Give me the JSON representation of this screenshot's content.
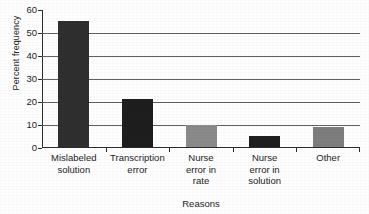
{
  "chart_data": {
    "type": "bar",
    "title": "",
    "subtitle": "",
    "xlabel": "Reasons",
    "ylabel": "Percent frequency",
    "categories": [
      "Mislabeled solution",
      "Transcription error",
      "Nurse error in rate",
      "Nurse error in solution",
      "Other"
    ],
    "category_lines": [
      [
        "Mislabeled",
        "solution"
      ],
      [
        "Transcription",
        "error"
      ],
      [
        "Nurse",
        "error in",
        "rate"
      ],
      [
        "Nurse",
        "error in",
        "solution"
      ],
      [
        "Other"
      ]
    ],
    "values": [
      55,
      21,
      9.5,
      5,
      8.5
    ],
    "bar_colors": [
      "#2f2f2f",
      "#1e1e1e",
      "#8a8a8a",
      "#1f1f1f",
      "#7e7e7e"
    ],
    "ylim": [
      0,
      60
    ],
    "yticks": [
      0,
      10,
      20,
      30,
      40,
      50,
      60
    ],
    "ytick_labels": [
      "0",
      "10",
      "20",
      "30",
      "40",
      "50",
      "60"
    ],
    "gridlines_at": [
      10,
      20,
      30,
      40,
      50
    ],
    "grid": true,
    "legend": false,
    "legend_position": "none"
  },
  "colors": {
    "axis": "#2c2c2c",
    "grid": "#616161",
    "text": "#1d1d1d",
    "background": "#fefefe"
  }
}
